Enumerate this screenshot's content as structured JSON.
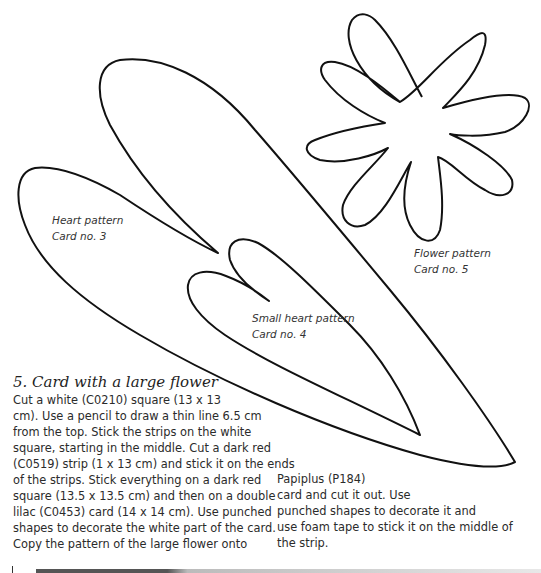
{
  "patterns": {
    "heart": {
      "title": "Heart pattern",
      "card": "Card no. 3"
    },
    "small_heart": {
      "title": "Small heart pattern",
      "card": "Card no. 4"
    },
    "flower": {
      "title": "Flower pattern",
      "card": "Card no. 5"
    }
  },
  "section": {
    "heading": "5. Card with a large flower",
    "left_lines": [
      "Cut a white (C0210) square (13 x 13",
      "cm). Use a pencil to draw a thin line 6.5 cm",
      "from the top. Stick the strips on the white",
      "square, starting in the middle. Cut a dark red",
      "(C0519) strip (1 x 13 cm) and stick it on the ends",
      "of the strips. Stick everything on a dark red",
      "square (13.5 x 13.5 cm) and then on a double",
      "lilac (C0453) card (14 x 14 cm). Use punched",
      "shapes to decorate the white part of the card.",
      "Copy the pattern of the large flower onto"
    ],
    "right_lines": [
      "Papiplus (P184)",
      "card and cut it out. Use",
      "punched shapes to decorate it and",
      "use foam tape to stick it on the middle of",
      "the strip."
    ]
  },
  "colors": {
    "ink": "#111111",
    "text": "#2b2b2b",
    "rule": "#555555"
  }
}
